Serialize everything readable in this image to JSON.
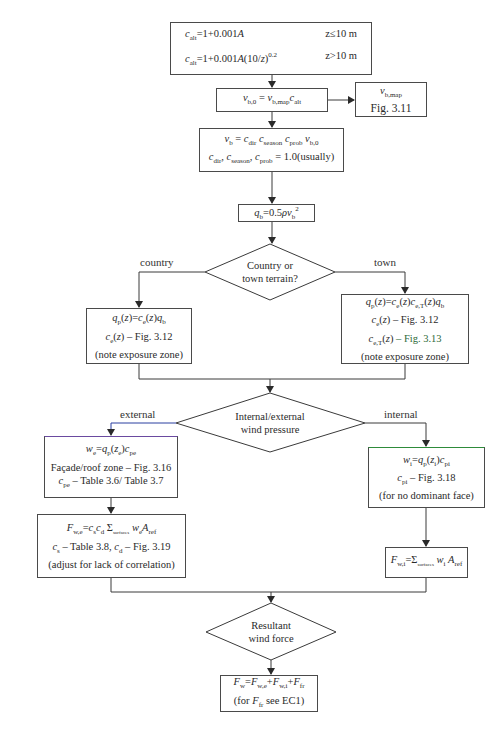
{
  "colors": {
    "line": "#3a3a3a",
    "text": "#2a2a2a",
    "accent_green": "#2e8b3a",
    "accent_blue": "#2b3fa0"
  },
  "nodes": {
    "c_alt": {
      "line1_eq": "c_alt = 1+0.001A",
      "line1_cond": "z≤10 m",
      "line2_eq": "c_alt = 1+0.001A(10/z)^0.2",
      "line2_cond": "z>10 m"
    },
    "v_b0": {
      "eq": "v_b,0 = v_b,map c_alt"
    },
    "v_bmap": {
      "line1": "v_b,map",
      "line2": "Fig. 3.11"
    },
    "v_b": {
      "line1": "v_b = c_dir c_season c_prob v_b,0",
      "line2": "c_dir, c_season, c_prob = 1.0(usually)"
    },
    "q_b": {
      "eq": "q_b = 0.5ρv_b²"
    },
    "terrain_decision": {
      "line1": "Country or",
      "line2": "town terrain?"
    },
    "country_box": {
      "line1": "q_p(z) = c_e(z)q_b",
      "line2": "c_e(z) – Fig. 3.12",
      "line3": "(note exposure zone)"
    },
    "town_box": {
      "line1": "q_p(z) = c_e(z)c_e,T(z)q_b",
      "line2": "c_e(z) – Fig. 3.12",
      "line3": "c_e,T(z) – Fig. 3.13",
      "line4": "(note exposure zone)"
    },
    "pressure_decision": {
      "line1": "Internal/external",
      "line2": "wind pressure"
    },
    "external_box": {
      "line1": "w_e = q_p(z_e)c_pe",
      "line2": "Façade/roof zone – Fig. 3.16",
      "line3": "c_pe – Table 3.6/ Table 3.7"
    },
    "fwe_box": {
      "line1": "F_w,e = c_s c_d Σ_surfaces w_e A_ref",
      "line2": "c_s – Table 3.8, c_d – Fig. 3.19",
      "line3": "(adjust for lack of correlation)"
    },
    "internal_box": {
      "line1": "w_i = q_p(z_i)c_pi",
      "line2": "c_pi – Fig. 3.18",
      "line3": "(for no dominant face)"
    },
    "fwi_box": {
      "line1": "F_w,i = Σ_surfaces w_i A_ref"
    },
    "resultant_decision": {
      "line1": "Resultant",
      "line2": "wind force"
    },
    "final_box": {
      "line1": "F_w = F_w,e + F_w,i + F_fr",
      "line2": "(for F_fr see EC1)"
    }
  },
  "edge_labels": {
    "country": "country",
    "town": "town",
    "external": "external",
    "internal": "internal"
  },
  "text": {
    "sum_under": "surfaces",
    "ten": "10",
    "z": "z",
    "exp": "0.2",
    "fig311": "Fig. 3.11",
    "usually": "= 1.0(usually)",
    "fig312": "– Fig. 3.12",
    "fig313": "– Fig. 3.13",
    "exposure": "(note exposure zone)",
    "facade": "Façade/roof zone – Fig. 3.16",
    "tbl36": "– Table 3.6/ Table 3.7",
    "tbl38": "– Table 3.8, ",
    "fig319": "– Fig. 3.19",
    "adjust": "(adjust for lack of correlation)",
    "fig318": "– Fig. 3.18",
    "nodominant": "(for no dominant face)",
    "seeEC1_pre": "(for ",
    "seeEC1_post": " see EC1)",
    "cond1": "z≤10 m",
    "cond2": "z>10 m",
    "alt_rhs1": "=1+0.001",
    "alt_rhs2": "=1+0.001"
  }
}
